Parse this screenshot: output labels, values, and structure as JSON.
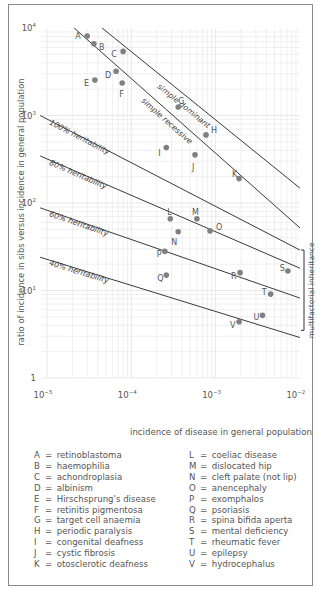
{
  "chart_data": {
    "type": "scatter",
    "scale": {
      "x": "log",
      "y": "log"
    },
    "title": "",
    "xlabel": "incidence of disease in general population",
    "ylabel": "ratio of incidence in sibs versus incidence in general population",
    "xlim": [
      1e-05,
      0.01
    ],
    "ylim": [
      1,
      10000
    ],
    "grid": true,
    "x_ticks": [
      {
        "value": 1e-05,
        "base": "10",
        "exp": "−5"
      },
      {
        "value": 0.0001,
        "base": "10",
        "exp": "−4"
      },
      {
        "value": 0.001,
        "base": "10",
        "exp": "−3"
      },
      {
        "value": 0.01,
        "base": "10",
        "exp": "−2"
      }
    ],
    "y_ticks": [
      {
        "value": 10000,
        "base": "10",
        "exp": "4"
      },
      {
        "value": 1000,
        "base": "10",
        "exp": "3"
      },
      {
        "value": 100,
        "base": "10",
        "exp": "2"
      },
      {
        "value": 10,
        "base": "10",
        "exp": "1"
      },
      {
        "value": 1,
        "base": "1",
        "exp": ""
      }
    ],
    "points": [
      {
        "label": "A",
        "x": 3e-05,
        "y": 8100
      },
      {
        "label": "B",
        "x": 3.6e-05,
        "y": 6600
      },
      {
        "label": "C",
        "x": 8e-05,
        "y": 5400
      },
      {
        "label": "D",
        "x": 6.6e-05,
        "y": 3200
      },
      {
        "label": "E",
        "x": 3.7e-05,
        "y": 2550
      },
      {
        "label": "F",
        "x": 7.8e-05,
        "y": 2350
      },
      {
        "label": "G",
        "x": 0.00036,
        "y": 1250
      },
      {
        "label": "H",
        "x": 0.00077,
        "y": 600
      },
      {
        "label": "I",
        "x": 0.00026,
        "y": 430
      },
      {
        "label": "J",
        "x": 0.00057,
        "y": 355
      },
      {
        "label": "K",
        "x": 0.0019,
        "y": 190
      },
      {
        "label": "L",
        "x": 0.00029,
        "y": 66
      },
      {
        "label": "M",
        "x": 0.0006,
        "y": 66
      },
      {
        "label": "N",
        "x": 0.00036,
        "y": 47
      },
      {
        "label": "O",
        "x": 0.00086,
        "y": 48
      },
      {
        "label": "P",
        "x": 0.00025,
        "y": 28
      },
      {
        "label": "Q",
        "x": 0.00026,
        "y": 15
      },
      {
        "label": "R",
        "x": 0.00195,
        "y": 16
      },
      {
        "label": "S",
        "x": 0.0072,
        "y": 16.7
      },
      {
        "label": "T",
        "x": 0.0045,
        "y": 9.1
      },
      {
        "label": "U",
        "x": 0.0036,
        "y": 5.2
      },
      {
        "label": "V",
        "x": 0.0019,
        "y": 4.4
      }
    ],
    "label_offsets": {
      "A": [
        -12,
        0
      ],
      "B": [
        5,
        3
      ],
      "C": [
        -12,
        3
      ],
      "D": [
        -11,
        4
      ],
      "E": [
        -11,
        3
      ],
      "F": [
        -3,
        11
      ],
      "G": [
        0,
        -6
      ],
      "H": [
        5,
        -5
      ],
      "I": [
        -8,
        5
      ],
      "J": [
        -3,
        12
      ],
      "K": [
        -7,
        -5
      ],
      "L": [
        -3,
        -7
      ],
      "M": [
        -5,
        -7
      ],
      "N": [
        -7,
        10
      ],
      "O": [
        6,
        -4
      ],
      "P": [
        -8,
        3
      ],
      "Q": [
        -9,
        3
      ],
      "R": [
        -9,
        3
      ],
      "S": [
        -8,
        -3
      ],
      "T": [
        -9,
        -2
      ],
      "U": [
        -9,
        2
      ],
      "V": [
        -9,
        3
      ]
    },
    "lines": [
      {
        "name": "simple dominant",
        "label": "simple dominant",
        "from": [
          4.5e-05,
          10000
        ],
        "to": [
          0.01,
          148
        ],
        "label_at": [
          0.0002,
          2100
        ]
      },
      {
        "name": "simple recessive",
        "label": "simple recessive",
        "from": [
          2.1e-05,
          10000
        ],
        "to": [
          0.01,
          52
        ],
        "label_at": [
          0.00013,
          1450
        ]
      },
      {
        "name": "100% heritability",
        "label": "100% heritability",
        "from": [
          8.3e-06,
          1000
        ],
        "to": [
          0.01,
          29
        ],
        "label_at": [
          1.05e-05,
          800
        ]
      },
      {
        "name": "80% heritability",
        "label": "80% heritability",
        "from": [
          8.3e-06,
          345
        ],
        "to": [
          0.01,
          18
        ],
        "label_at": [
          1.05e-05,
          275
        ]
      },
      {
        "name": "60% heritability",
        "label": "60% heritability",
        "from": [
          8.3e-06,
          88
        ],
        "to": [
          0.01,
          8.2
        ],
        "label_at": [
          1.05e-05,
          71
        ]
      },
      {
        "name": "40% heritability",
        "label": "40% heritability",
        "from": [
          8.3e-06,
          24
        ],
        "to": [
          0.01,
          2.9
        ],
        "label_at": [
          1.05e-05,
          19.5
        ]
      }
    ],
    "annotations": [
      {
        "text": "multifactorial inheritance",
        "bracket_y": [
          29,
          3.5
        ]
      }
    ],
    "legend": {
      "left": [
        {
          "key": "A",
          "name": "retinoblastoma"
        },
        {
          "key": "B",
          "name": "haemophilia"
        },
        {
          "key": "C",
          "name": "achondroplasia"
        },
        {
          "key": "D",
          "name": "albinism"
        },
        {
          "key": "E",
          "name": "Hirschsprung's disease"
        },
        {
          "key": "F",
          "name": "retinitis pigmentosa"
        },
        {
          "key": "G",
          "name": "target cell anaemia"
        },
        {
          "key": "H",
          "name": "periodic paralysis"
        },
        {
          "key": "I",
          "name": "congenital deafness"
        },
        {
          "key": "J",
          "name": "cystic fibrosis"
        },
        {
          "key": "K",
          "name": "otosclerotic deafness"
        }
      ],
      "right": [
        {
          "key": "L",
          "name": "coeliac disease"
        },
        {
          "key": "M",
          "name": "dislocated hip"
        },
        {
          "key": "N",
          "name": "cleft palate (not lip)"
        },
        {
          "key": "O",
          "name": "anencephaly"
        },
        {
          "key": "P",
          "name": "exomphalos"
        },
        {
          "key": "Q",
          "name": "psoriasis"
        },
        {
          "key": "R",
          "name": "spina bifida aperta"
        },
        {
          "key": "S",
          "name": "mental deficiency"
        },
        {
          "key": "T",
          "name": "rheumatic fever"
        },
        {
          "key": "U",
          "name": "epilepsy"
        },
        {
          "key": "V",
          "name": "hydrocephalus"
        }
      ]
    }
  },
  "colors": {
    "point": "#808080",
    "line": "#3a3a3a",
    "grid": "#e6e6e6",
    "text": "#555555",
    "frame": "#8a8a8a"
  },
  "legend_eq": "="
}
